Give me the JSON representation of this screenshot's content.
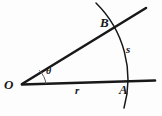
{
  "figure": {
    "type": "geometry-diagram",
    "background_color": "#fdfdfd",
    "ink_color": "#18181a",
    "points": {
      "vertex": {
        "label": "O",
        "x": 22,
        "y": 84
      },
      "on_horizontal_ray": {
        "label": "A",
        "x": 128,
        "y": 80
      },
      "on_inclined_ray": {
        "label": "B",
        "x": 114,
        "y": 27
      }
    },
    "labels": {
      "radius": "r",
      "arc_length": "s",
      "angle": "θ"
    },
    "rays": [
      {
        "name": "horizontal-ray",
        "from": [
          22,
          84
        ],
        "to": [
          155,
          80
        ]
      },
      {
        "name": "inclined-ray",
        "from": [
          22,
          84
        ],
        "to": [
          146,
          8
        ]
      }
    ],
    "arc": {
      "name": "radius-arc",
      "center": [
        22,
        84
      ],
      "radius": 107,
      "start": [
        96,
        3
      ],
      "end": [
        124,
        108
      ]
    },
    "angle_marker": {
      "name": "angle-arc",
      "center": [
        22,
        84
      ],
      "radius": 24
    }
  }
}
